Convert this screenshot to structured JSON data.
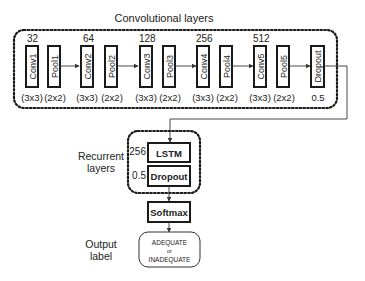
{
  "title": "Convolutional layers",
  "conv_layers": [
    {
      "channels": "32",
      "conv": "Conv1",
      "pool": "Pool1",
      "conv_kernel": "(3x3)",
      "pool_kernel": "(2x2)"
    },
    {
      "channels": "64",
      "conv": "Conv2",
      "pool": "Pool2",
      "conv_kernel": "(3x3)",
      "pool_kernel": "(2x2)"
    },
    {
      "channels": "128",
      "conv": "Conv3",
      "pool": "Pool3",
      "conv_kernel": "(3x3)",
      "pool_kernel": "(2x2)"
    },
    {
      "channels": "256",
      "conv": "Conv4",
      "pool": "Pool4",
      "conv_kernel": "(3x3)",
      "pool_kernel": "(2x2)"
    },
    {
      "channels": "512",
      "conv": "Conv5",
      "pool": "Pool5",
      "conv_kernel": "(3x3)",
      "pool_kernel": "(2x2)"
    }
  ],
  "conv_dropout": {
    "label": "Dropout",
    "rate": "0.5"
  },
  "recurrent": {
    "label_line1": "Recurrent",
    "label_line2": "layers",
    "lstm": {
      "label": "LSTM",
      "units": "256"
    },
    "dropout": {
      "label": "Dropout",
      "rate": "0.5"
    }
  },
  "softmax": {
    "label": "Softmax"
  },
  "output": {
    "label_line1": "Output",
    "label_line2": "label",
    "value_line1": "ADEQUATE",
    "value_line2": "or",
    "value_line3": "INADEQUATE"
  }
}
